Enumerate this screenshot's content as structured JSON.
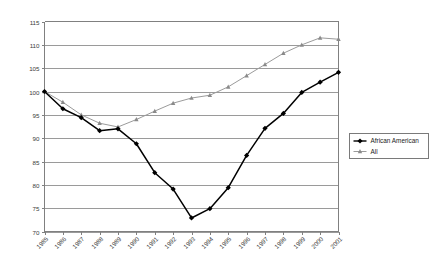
{
  "chart_data": {
    "type": "line",
    "title": "",
    "subtitle": "",
    "xlabel": "",
    "ylabel": "",
    "ylim": [
      70,
      115
    ],
    "ytick_step": 5,
    "yticks": [
      70,
      75,
      80,
      85,
      90,
      95,
      100,
      105,
      110,
      115
    ],
    "grid": true,
    "grid_axis": "y",
    "legend_position": "right",
    "categories": [
      "1985",
      "1986",
      "1987",
      "1988",
      "1989",
      "1990",
      "1991",
      "1992",
      "1993",
      "1994",
      "1995",
      "1996",
      "1997",
      "1998",
      "1999",
      "2000",
      "2001"
    ],
    "series": [
      {
        "name": "African American",
        "color": "#000000",
        "marker": "diamond",
        "values": [
          100.0,
          96.3,
          94.4,
          91.6,
          92.0,
          88.8,
          82.6,
          79.1,
          72.9,
          74.9,
          79.4,
          86.3,
          92.1,
          95.3,
          99.8,
          102.0,
          104.1
        ]
      },
      {
        "name": "All",
        "color": "#8a8a8a",
        "marker": "triangle",
        "values": [
          100.0,
          97.7,
          95.0,
          93.2,
          92.4,
          94.0,
          95.8,
          97.5,
          98.6,
          99.2,
          101.0,
          103.4,
          105.8,
          108.2,
          110.0,
          111.5,
          111.2
        ]
      }
    ]
  },
  "legend": {
    "entries": [
      {
        "label": "African American"
      },
      {
        "label": "All"
      }
    ]
  }
}
